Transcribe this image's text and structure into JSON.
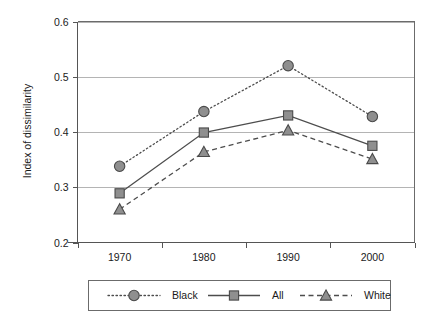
{
  "chart_data": {
    "type": "line",
    "title": "",
    "xlabel": "",
    "ylabel": "Index of dissimilarity",
    "categories": [
      "1970",
      "1980",
      "1990",
      "2000"
    ],
    "x": [
      1970,
      1980,
      1990,
      2000
    ],
    "ylim": [
      0.2,
      0.6
    ],
    "yticks": [
      "0.2",
      "0.3",
      "0.4",
      "0.5",
      "0.6"
    ],
    "ytick_values": [
      0.2,
      0.3,
      0.4,
      0.5,
      0.6
    ],
    "grid": true,
    "legend_position": "bottom",
    "series": [
      {
        "name": "Black",
        "values": [
          0.338,
          0.437,
          0.52,
          0.428
        ],
        "linestyle": "dotted",
        "marker": "circle",
        "color": "#8f8f8f"
      },
      {
        "name": "All",
        "values": [
          0.289,
          0.399,
          0.43,
          0.375
        ],
        "linestyle": "solid",
        "marker": "square",
        "color": "#8f8f8f"
      },
      {
        "name": "White",
        "values": [
          0.26,
          0.364,
          0.403,
          0.351
        ],
        "linestyle": "dashed",
        "marker": "triangle",
        "color": "#8f8f8f"
      }
    ]
  },
  "legend": {
    "entries": [
      {
        "label": "Black"
      },
      {
        "label": "All"
      },
      {
        "label": "White"
      }
    ]
  },
  "colors": {
    "marker_fill": "#8f8f8f",
    "marker_stroke": "#4a4a4a",
    "line": "#4d4d4d",
    "grid": "#b4b4b4",
    "axis": "#555555",
    "background": "#ffffff"
  }
}
